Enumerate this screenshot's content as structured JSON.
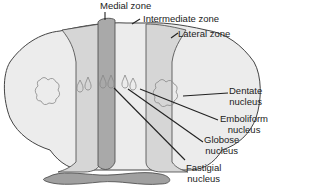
{
  "diagram": {
    "labels": {
      "medial_zone": "Medial zone",
      "intermediate_zone": "Intermediate zone",
      "lateral_zone": "Lateral zone",
      "dentate": [
        "Dentate",
        "nucleus"
      ],
      "emboliform": [
        "Emboliform",
        "nucleus"
      ],
      "globose": [
        "Globose",
        "nucleus"
      ],
      "fastigial": [
        "Fastigial",
        "nucleus"
      ]
    },
    "colors": {
      "lateral": "#ececec",
      "intermediate": "#d6d6d6",
      "medial": "#a9a9a9",
      "outline": "#444444",
      "nucleus": "#888888",
      "peduncle": "#a0a0a0"
    }
  }
}
